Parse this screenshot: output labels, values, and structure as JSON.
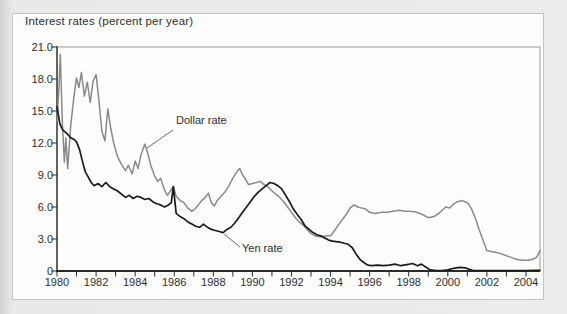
{
  "page": {
    "background_color": "#e9e9e7",
    "card_background": "#fdfdfc",
    "card_border_color": "#c4c4c2"
  },
  "chart_data": {
    "type": "line",
    "title": "Interest rates (percent per year)",
    "xlabel": "",
    "ylabel": "Interest rates (percent per year)",
    "xlim": [
      1980,
      2004.75
    ],
    "ylim": [
      0,
      21
    ],
    "grid": false,
    "legend_position": "inline-annotations",
    "yticks": [
      21,
      18,
      15,
      12,
      9,
      6,
      3,
      0
    ],
    "ytick_labels": [
      "21.0",
      "18.0",
      "15.0",
      "12.0",
      "9.0",
      "6.0",
      "3.0",
      "0"
    ],
    "xticks": [
      1980,
      1982,
      1984,
      1986,
      1988,
      1990,
      1992,
      1994,
      1996,
      1998,
      2000,
      2002,
      2004
    ],
    "xtick_labels": [
      "1980",
      "1982",
      "1984",
      "1986",
      "1988",
      "1990",
      "1992",
      "1994",
      "1996",
      "1998",
      "2000",
      "2002",
      "2004"
    ],
    "minor_xtick_interval_years": 1,
    "axis_color": "#2a2a2a",
    "frame_color": "#9a9a9a",
    "annotations": [
      {
        "text": "Dollar rate",
        "series": "Dollar rate",
        "points_at": {
          "x": 1984.5,
          "y": 11.9
        }
      },
      {
        "text": "Yen rate",
        "series": "Yen rate",
        "points_at": {
          "x": 1988.45,
          "y": 3.65
        }
      }
    ],
    "series": [
      {
        "name": "Dollar rate",
        "color": "#8a8a8a",
        "width": 1.5,
        "points": [
          [
            1980.0,
            14.0
          ],
          [
            1980.1,
            17.3
          ],
          [
            1980.17,
            20.3
          ],
          [
            1980.28,
            13.5
          ],
          [
            1980.38,
            10.2
          ],
          [
            1980.45,
            12.5
          ],
          [
            1980.55,
            9.6
          ],
          [
            1980.7,
            13.6
          ],
          [
            1980.85,
            16.1
          ],
          [
            1981.0,
            18.1
          ],
          [
            1981.12,
            17.2
          ],
          [
            1981.25,
            18.6
          ],
          [
            1981.4,
            16.4
          ],
          [
            1981.55,
            17.7
          ],
          [
            1981.7,
            15.8
          ],
          [
            1981.85,
            17.8
          ],
          [
            1982.0,
            18.4
          ],
          [
            1982.15,
            15.9
          ],
          [
            1982.3,
            13.1
          ],
          [
            1982.45,
            12.2
          ],
          [
            1982.6,
            15.2
          ],
          [
            1982.75,
            13.4
          ],
          [
            1982.9,
            12.0
          ],
          [
            1983.1,
            10.7
          ],
          [
            1983.3,
            10.0
          ],
          [
            1983.5,
            9.4
          ],
          [
            1983.65,
            9.9
          ],
          [
            1983.85,
            9.1
          ],
          [
            1984.0,
            10.3
          ],
          [
            1984.15,
            9.6
          ],
          [
            1984.3,
            10.9
          ],
          [
            1984.5,
            11.9
          ],
          [
            1984.65,
            11.0
          ],
          [
            1984.8,
            9.9
          ],
          [
            1985.0,
            8.9
          ],
          [
            1985.15,
            8.4
          ],
          [
            1985.3,
            8.7
          ],
          [
            1985.5,
            7.6
          ],
          [
            1985.65,
            7.1
          ],
          [
            1985.8,
            7.5
          ],
          [
            1985.95,
            7.9
          ],
          [
            1986.1,
            7.0
          ],
          [
            1986.3,
            6.6
          ],
          [
            1986.5,
            6.4
          ],
          [
            1986.7,
            5.9
          ],
          [
            1986.9,
            5.6
          ],
          [
            1987.05,
            5.8
          ],
          [
            1987.2,
            6.1
          ],
          [
            1987.4,
            6.6
          ],
          [
            1987.6,
            6.9
          ],
          [
            1987.75,
            7.3
          ],
          [
            1987.9,
            6.4
          ],
          [
            1988.05,
            6.1
          ],
          [
            1988.2,
            6.6
          ],
          [
            1988.4,
            7.0
          ],
          [
            1988.6,
            7.4
          ],
          [
            1988.8,
            8.0
          ],
          [
            1989.0,
            8.7
          ],
          [
            1989.2,
            9.3
          ],
          [
            1989.35,
            9.6
          ],
          [
            1989.5,
            9.0
          ],
          [
            1989.65,
            8.6
          ],
          [
            1989.8,
            8.1
          ],
          [
            1990.0,
            8.2
          ],
          [
            1990.2,
            8.3
          ],
          [
            1990.4,
            8.4
          ],
          [
            1990.6,
            8.1
          ],
          [
            1990.8,
            7.9
          ],
          [
            1991.0,
            7.5
          ],
          [
            1991.2,
            7.2
          ],
          [
            1991.4,
            6.9
          ],
          [
            1991.6,
            6.5
          ],
          [
            1991.8,
            6.0
          ],
          [
            1992.0,
            5.5
          ],
          [
            1992.2,
            5.0
          ],
          [
            1992.4,
            4.6
          ],
          [
            1992.6,
            4.3
          ],
          [
            1992.8,
            3.9
          ],
          [
            1993.0,
            3.5
          ],
          [
            1993.2,
            3.3
          ],
          [
            1993.5,
            3.2
          ],
          [
            1993.8,
            3.3
          ],
          [
            1994.0,
            3.3
          ],
          [
            1994.2,
            3.8
          ],
          [
            1994.4,
            4.3
          ],
          [
            1994.6,
            4.8
          ],
          [
            1994.8,
            5.3
          ],
          [
            1995.0,
            5.9
          ],
          [
            1995.2,
            6.2
          ],
          [
            1995.4,
            6.0
          ],
          [
            1995.6,
            5.9
          ],
          [
            1995.8,
            5.8
          ],
          [
            1996.0,
            5.5
          ],
          [
            1996.3,
            5.4
          ],
          [
            1996.6,
            5.5
          ],
          [
            1996.9,
            5.5
          ],
          [
            1997.2,
            5.6
          ],
          [
            1997.5,
            5.7
          ],
          [
            1997.8,
            5.6
          ],
          [
            1998.1,
            5.6
          ],
          [
            1998.4,
            5.5
          ],
          [
            1998.7,
            5.3
          ],
          [
            1999.0,
            5.0
          ],
          [
            1999.3,
            5.1
          ],
          [
            1999.6,
            5.5
          ],
          [
            1999.9,
            6.0
          ],
          [
            2000.1,
            5.9
          ],
          [
            2000.3,
            6.3
          ],
          [
            2000.5,
            6.5
          ],
          [
            2000.75,
            6.6
          ],
          [
            2001.0,
            6.4
          ],
          [
            2001.2,
            5.9
          ],
          [
            2001.4,
            5.0
          ],
          [
            2001.6,
            3.9
          ],
          [
            2001.8,
            2.9
          ],
          [
            2002.0,
            1.9
          ],
          [
            2002.3,
            1.8
          ],
          [
            2002.6,
            1.7
          ],
          [
            2002.9,
            1.5
          ],
          [
            2003.2,
            1.3
          ],
          [
            2003.5,
            1.1
          ],
          [
            2003.8,
            1.0
          ],
          [
            2004.1,
            1.0
          ],
          [
            2004.35,
            1.1
          ],
          [
            2004.55,
            1.3
          ],
          [
            2004.75,
            1.9
          ]
        ]
      },
      {
        "name": "Yen rate",
        "color": "#1b1b1b",
        "width": 1.7,
        "points": [
          [
            1980.0,
            15.4
          ],
          [
            1980.15,
            13.8
          ],
          [
            1980.3,
            13.2
          ],
          [
            1980.5,
            12.9
          ],
          [
            1980.7,
            12.5
          ],
          [
            1980.9,
            12.3
          ],
          [
            1981.0,
            12.1
          ],
          [
            1981.15,
            11.4
          ],
          [
            1981.3,
            10.3
          ],
          [
            1981.45,
            9.3
          ],
          [
            1981.6,
            8.8
          ],
          [
            1981.75,
            8.3
          ],
          [
            1981.9,
            8.0
          ],
          [
            1982.1,
            8.2
          ],
          [
            1982.3,
            7.9
          ],
          [
            1982.5,
            8.3
          ],
          [
            1982.7,
            7.9
          ],
          [
            1982.9,
            7.7
          ],
          [
            1983.1,
            7.5
          ],
          [
            1983.3,
            7.2
          ],
          [
            1983.5,
            6.9
          ],
          [
            1983.7,
            7.1
          ],
          [
            1983.9,
            6.8
          ],
          [
            1984.1,
            7.0
          ],
          [
            1984.3,
            6.9
          ],
          [
            1984.5,
            6.7
          ],
          [
            1984.7,
            6.8
          ],
          [
            1984.9,
            6.5
          ],
          [
            1985.1,
            6.3
          ],
          [
            1985.3,
            6.2
          ],
          [
            1985.5,
            6.0
          ],
          [
            1985.7,
            6.2
          ],
          [
            1985.85,
            6.4
          ],
          [
            1985.95,
            7.9
          ],
          [
            1986.1,
            5.4
          ],
          [
            1986.3,
            5.1
          ],
          [
            1986.5,
            4.9
          ],
          [
            1986.7,
            4.6
          ],
          [
            1986.9,
            4.4
          ],
          [
            1987.1,
            4.2
          ],
          [
            1987.3,
            4.1
          ],
          [
            1987.5,
            4.4
          ],
          [
            1987.7,
            4.1
          ],
          [
            1987.9,
            3.9
          ],
          [
            1988.1,
            3.8
          ],
          [
            1988.3,
            3.7
          ],
          [
            1988.5,
            3.6
          ],
          [
            1988.7,
            3.9
          ],
          [
            1988.9,
            4.1
          ],
          [
            1989.1,
            4.5
          ],
          [
            1989.3,
            5.0
          ],
          [
            1989.5,
            5.5
          ],
          [
            1989.7,
            6.0
          ],
          [
            1989.9,
            6.5
          ],
          [
            1990.1,
            7.0
          ],
          [
            1990.3,
            7.4
          ],
          [
            1990.5,
            7.7
          ],
          [
            1990.7,
            8.0
          ],
          [
            1990.9,
            8.3
          ],
          [
            1991.1,
            8.2
          ],
          [
            1991.3,
            8.0
          ],
          [
            1991.5,
            7.7
          ],
          [
            1991.7,
            7.1
          ],
          [
            1991.9,
            6.5
          ],
          [
            1992.1,
            5.8
          ],
          [
            1992.3,
            5.3
          ],
          [
            1992.5,
            4.8
          ],
          [
            1992.7,
            4.2
          ],
          [
            1992.9,
            3.9
          ],
          [
            1993.1,
            3.6
          ],
          [
            1993.3,
            3.4
          ],
          [
            1993.5,
            3.3
          ],
          [
            1993.7,
            3.1
          ],
          [
            1993.9,
            2.9
          ],
          [
            1994.1,
            2.8
          ],
          [
            1994.3,
            2.75
          ],
          [
            1994.5,
            2.7
          ],
          [
            1994.7,
            2.6
          ],
          [
            1994.9,
            2.5
          ],
          [
            1995.1,
            2.2
          ],
          [
            1995.3,
            1.6
          ],
          [
            1995.5,
            1.1
          ],
          [
            1995.7,
            0.8
          ],
          [
            1995.9,
            0.55
          ],
          [
            1996.1,
            0.5
          ],
          [
            1996.4,
            0.55
          ],
          [
            1996.7,
            0.5
          ],
          [
            1997.0,
            0.55
          ],
          [
            1997.3,
            0.65
          ],
          [
            1997.6,
            0.5
          ],
          [
            1997.9,
            0.6
          ],
          [
            1998.2,
            0.7
          ],
          [
            1998.45,
            0.5
          ],
          [
            1998.65,
            0.65
          ],
          [
            1998.85,
            0.4
          ],
          [
            1999.1,
            0.1
          ],
          [
            1999.4,
            0.05
          ],
          [
            1999.7,
            0.05
          ],
          [
            2000.0,
            0.1
          ],
          [
            2000.3,
            0.25
          ],
          [
            2000.6,
            0.35
          ],
          [
            2000.9,
            0.3
          ],
          [
            2001.1,
            0.15
          ],
          [
            2001.3,
            0.05
          ],
          [
            2001.6,
            0.05
          ],
          [
            2002.0,
            0.05
          ],
          [
            2002.5,
            0.05
          ],
          [
            2003.0,
            0.05
          ],
          [
            2003.5,
            0.05
          ],
          [
            2004.0,
            0.05
          ],
          [
            2004.4,
            0.07
          ],
          [
            2004.75,
            0.07
          ]
        ]
      }
    ]
  }
}
